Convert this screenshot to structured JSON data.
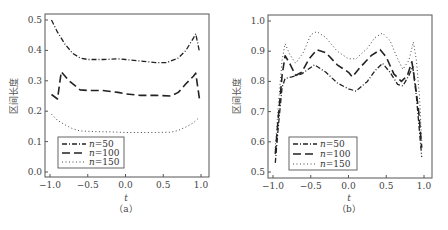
{
  "chart_data": [
    {
      "panel": "(a)",
      "type": "line",
      "title": "",
      "xlabel": "t",
      "ylabel": "区间长度",
      "xlim": [
        -1.0,
        1.0
      ],
      "ylim": [
        0.0,
        0.5
      ],
      "xticks": [
        "-1.0",
        "-0.5",
        "0.0",
        "0.5",
        "1.0"
      ],
      "yticks": [
        "0.0",
        "0.1",
        "0.2",
        "0.3",
        "0.4",
        "0.5"
      ],
      "grid": false,
      "legend_position": "lower left",
      "series": [
        {
          "name": "n=50",
          "style": "dashdot",
          "x": [
            -0.98,
            -0.9,
            -0.8,
            -0.7,
            -0.6,
            -0.5,
            -0.3,
            -0.1,
            0.0,
            0.2,
            0.4,
            0.55,
            0.7,
            0.8,
            0.9,
            0.93,
            0.98
          ],
          "y": [
            0.5,
            0.46,
            0.42,
            0.39,
            0.375,
            0.37,
            0.37,
            0.372,
            0.37,
            0.365,
            0.36,
            0.36,
            0.375,
            0.4,
            0.44,
            0.455,
            0.395
          ]
        },
        {
          "name": "n=100",
          "style": "dashed",
          "x": [
            -0.98,
            -0.9,
            -0.85,
            -0.75,
            -0.6,
            -0.5,
            -0.3,
            -0.1,
            0.0,
            0.2,
            0.4,
            0.6,
            0.7,
            0.8,
            0.9,
            0.93,
            0.98
          ],
          "y": [
            0.255,
            0.24,
            0.33,
            0.3,
            0.27,
            0.268,
            0.268,
            0.262,
            0.257,
            0.252,
            0.252,
            0.25,
            0.262,
            0.29,
            0.315,
            0.325,
            0.24
          ]
        },
        {
          "name": "n=150",
          "style": "dotted",
          "x": [
            -0.98,
            -0.9,
            -0.8,
            -0.7,
            -0.6,
            -0.4,
            -0.2,
            0.0,
            0.2,
            0.4,
            0.6,
            0.7,
            0.8,
            0.9,
            0.97
          ],
          "y": [
            0.19,
            0.17,
            0.155,
            0.142,
            0.135,
            0.133,
            0.132,
            0.13,
            0.13,
            0.13,
            0.131,
            0.137,
            0.148,
            0.162,
            0.178
          ]
        }
      ]
    },
    {
      "panel": "(b)",
      "type": "line",
      "title": "",
      "xlabel": "t",
      "ylabel": "区间长度",
      "xlim": [
        -1.0,
        1.0
      ],
      "ylim": [
        0.5,
        1.0
      ],
      "xticks": [
        "-1.0",
        "-0.5",
        "0.0",
        "0.5",
        "1.0"
      ],
      "yticks": [
        "0.5",
        "0.6",
        "0.7",
        "0.8",
        "0.9",
        "1.0"
      ],
      "grid": false,
      "legend_position": "lower left",
      "series": [
        {
          "name": "n=50",
          "style": "dashdot",
          "x": [
            -0.97,
            -0.93,
            -0.88,
            -0.84,
            -0.75,
            -0.62,
            -0.45,
            -0.3,
            -0.15,
            0.0,
            0.1,
            0.25,
            0.35,
            0.45,
            0.55,
            0.65,
            0.72,
            0.8,
            0.85,
            0.9,
            0.97
          ],
          "y": [
            0.53,
            0.65,
            0.78,
            0.81,
            0.815,
            0.825,
            0.855,
            0.83,
            0.795,
            0.775,
            0.768,
            0.8,
            0.835,
            0.86,
            0.83,
            0.79,
            0.785,
            0.82,
            0.85,
            0.75,
            0.55
          ]
        },
        {
          "name": "n=100",
          "style": "dashed",
          "x": [
            -0.97,
            -0.93,
            -0.88,
            -0.84,
            -0.78,
            -0.7,
            -0.62,
            -0.52,
            -0.42,
            -0.3,
            -0.15,
            0.0,
            0.05,
            0.15,
            0.3,
            0.42,
            0.5,
            0.6,
            0.7,
            0.78,
            0.84,
            0.88,
            0.93,
            0.97
          ],
          "y": [
            0.56,
            0.68,
            0.82,
            0.885,
            0.86,
            0.82,
            0.83,
            0.875,
            0.905,
            0.895,
            0.855,
            0.83,
            0.815,
            0.845,
            0.885,
            0.905,
            0.88,
            0.825,
            0.8,
            0.82,
            0.865,
            0.8,
            0.7,
            0.58
          ]
        },
        {
          "name": "n=150",
          "style": "dotted",
          "x": [
            -0.97,
            -0.93,
            -0.88,
            -0.84,
            -0.78,
            -0.7,
            -0.6,
            -0.5,
            -0.42,
            -0.3,
            -0.15,
            0.0,
            0.1,
            0.25,
            0.35,
            0.45,
            0.55,
            0.65,
            0.72,
            0.8,
            0.86,
            0.9,
            0.94,
            0.97
          ],
          "y": [
            0.58,
            0.72,
            0.87,
            0.925,
            0.89,
            0.86,
            0.895,
            0.955,
            0.965,
            0.945,
            0.9,
            0.875,
            0.875,
            0.91,
            0.945,
            0.96,
            0.935,
            0.875,
            0.84,
            0.87,
            0.93,
            0.87,
            0.75,
            0.6
          ]
        }
      ]
    }
  ],
  "panels": {
    "a": {
      "label": "（a）",
      "xlabel": "t",
      "ylabel": "区间长度"
    },
    "b": {
      "label": "（b）",
      "xlabel": "t",
      "ylabel": "区间长度"
    }
  },
  "legend": {
    "n_symbol": "n",
    "entries": [
      "=50",
      "=100",
      "=150"
    ]
  },
  "caption": ""
}
